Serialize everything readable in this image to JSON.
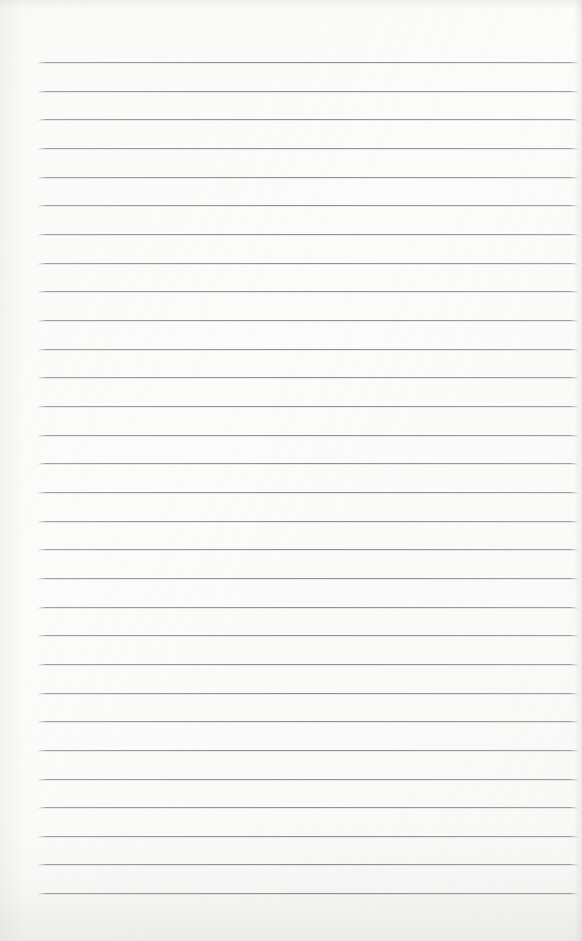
{
  "page": {
    "type": "blank-ruled-notebook-page",
    "text_content": "",
    "ruling": {
      "line_count": 30,
      "first_line_y": 62,
      "line_spacing": 28.66,
      "line_left": 38,
      "line_right": 578
    },
    "colors": {
      "paper": "#fcfcfb",
      "rule_line": "#828282",
      "edge_shade": "#b9b9b4"
    }
  }
}
